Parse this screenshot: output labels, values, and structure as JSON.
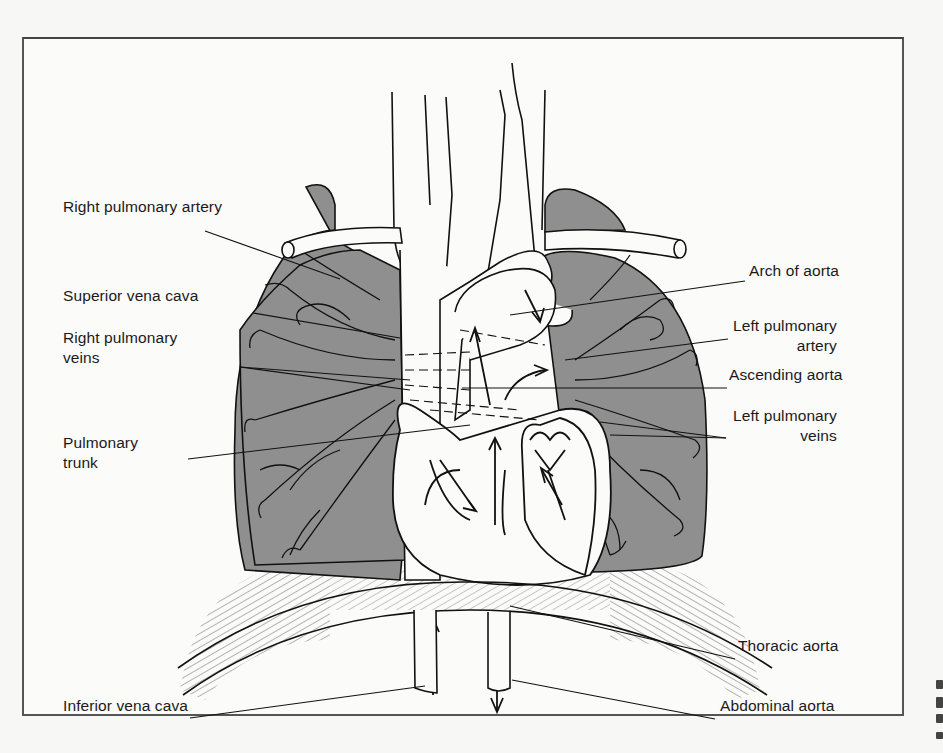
{
  "figure": {
    "colors": {
      "lung_fill": "#8f8f8f",
      "line": "#111111",
      "frame": "#555555",
      "background": "#fbfbf9"
    }
  },
  "labels": {
    "left": [
      {
        "id": "right-pulmonary-artery",
        "line1": "Right pulmonary artery",
        "line2": "",
        "x": 63,
        "y": 207
      },
      {
        "id": "superior-vena-cava",
        "line1": "Superior vena cava",
        "line2": "",
        "x": 63,
        "y": 296
      },
      {
        "id": "right-pulmonary-veins",
        "line1": "Right pulmonary",
        "line2": "veins",
        "x": 63,
        "y": 338
      },
      {
        "id": "pulmonary-trunk",
        "line1": "Pulmonary",
        "line2": "trunk",
        "x": 63,
        "y": 443
      },
      {
        "id": "inferior-vena-cava",
        "line1": "Inferior vena cava",
        "line2": "",
        "x": 63,
        "y": 706
      }
    ],
    "right": [
      {
        "id": "arch-of-aorta",
        "line1": "Arch of aorta",
        "line2": "",
        "x": 749,
        "y": 271
      },
      {
        "id": "left-pulmonary-artery",
        "line1": "Left pulmonary",
        "line2": "artery",
        "x": 733,
        "y": 326
      },
      {
        "id": "ascending-aorta",
        "line1": "Ascending aorta",
        "line2": "",
        "x": 729,
        "y": 375
      },
      {
        "id": "left-pulmonary-veins",
        "line1": "Left pulmonary",
        "line2": "veins",
        "x": 733,
        "y": 416
      },
      {
        "id": "thoracic-aorta",
        "line1": "Thoracic aorta",
        "line2": "",
        "x": 738,
        "y": 646
      },
      {
        "id": "abdominal-aorta",
        "line1": "Abdominal aorta",
        "line2": "",
        "x": 720,
        "y": 706
      }
    ]
  },
  "leader_lines": [
    {
      "for": "right-pulmonary-artery",
      "x1": 205,
      "y1": 231,
      "x2": 340,
      "y2": 279
    },
    {
      "for": "superior-vena-cava",
      "x1": 253,
      "y1": 313,
      "x2": 400,
      "y2": 338
    },
    {
      "for": "right-pulmonary-veins",
      "x1": 240,
      "y1": 367,
      "x2": 410,
      "y2": 390
    },
    {
      "for": "right-pulmonary-veins",
      "x1": 240,
      "y1": 367,
      "x2": 410,
      "y2": 380
    },
    {
      "for": "pulmonary-trunk",
      "x1": 188,
      "y1": 459,
      "x2": 470,
      "y2": 425
    },
    {
      "for": "inferior-vena-cava",
      "x1": 190,
      "y1": 718,
      "x2": 425,
      "y2": 686
    },
    {
      "for": "arch-of-aorta",
      "x1": 745,
      "y1": 281,
      "x2": 510,
      "y2": 315
    },
    {
      "for": "left-pulmonary-artery",
      "x1": 728,
      "y1": 339,
      "x2": 565,
      "y2": 360
    },
    {
      "for": "ascending-aorta",
      "x1": 727,
      "y1": 388,
      "x2": 462,
      "y2": 388
    },
    {
      "for": "left-pulmonary-veins",
      "x1": 726,
      "y1": 438,
      "x2": 600,
      "y2": 422
    },
    {
      "for": "left-pulmonary-veins",
      "x1": 726,
      "y1": 438,
      "x2": 610,
      "y2": 435
    },
    {
      "for": "thoracic-aorta",
      "x1": 735,
      "y1": 659,
      "x2": 510,
      "y2": 606
    },
    {
      "for": "abdominal-aorta",
      "x1": 715,
      "y1": 719,
      "x2": 512,
      "y2": 680
    }
  ],
  "edge_fragments": [
    {
      "y": 680,
      "h": 9
    },
    {
      "y": 697,
      "h": 11
    },
    {
      "y": 714,
      "h": 9
    },
    {
      "y": 732,
      "h": 7
    }
  ]
}
